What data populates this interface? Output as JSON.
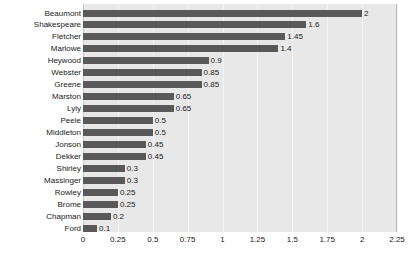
{
  "chart_data": {
    "type": "bar",
    "orientation": "horizontal",
    "title": "",
    "xlabel": "",
    "ylabel": "",
    "xlim": [
      0,
      2.25
    ],
    "grid": true,
    "legend": false,
    "xticks": [
      "0",
      "0.25",
      "0.5",
      "0.75",
      "1",
      "1.25",
      "1.5",
      "1.75",
      "2",
      "2.25"
    ],
    "xtick_values": [
      0,
      0.25,
      0.5,
      0.75,
      1,
      1.25,
      1.5,
      1.75,
      2,
      2.25
    ],
    "categories": [
      "Beaumont",
      "Shakespeare",
      "Fletcher",
      "Marlowe",
      "Heywood",
      "Webster",
      "Greene",
      "Marston",
      "Lyly",
      "Peele",
      "Middleton",
      "Jonson",
      "Dekker",
      "Shirley",
      "Massinger",
      "Rowley",
      "Brome",
      "Chapman",
      "Ford"
    ],
    "values": [
      2,
      1.6,
      1.45,
      1.4,
      0.9,
      0.85,
      0.85,
      0.65,
      0.65,
      0.5,
      0.5,
      0.45,
      0.45,
      0.3,
      0.3,
      0.25,
      0.25,
      0.2,
      0.1
    ],
    "value_labels": [
      "2",
      "1.6",
      "1.45",
      "1.4",
      "0.9",
      "0.85",
      "0.85",
      "0.65",
      "0.65",
      "0.5",
      "0.5",
      "0.45",
      "0.45",
      "0.3",
      "0.3",
      "0.25",
      "0.25",
      "0.2",
      "0.1"
    ],
    "colors": {
      "bar": "#595959",
      "plot_background": "#e8e8e8",
      "gridline": "#f4f4f4",
      "axis": "#c8c8c8",
      "text": "#1a1a1a",
      "canvas": "#ffffff"
    }
  }
}
